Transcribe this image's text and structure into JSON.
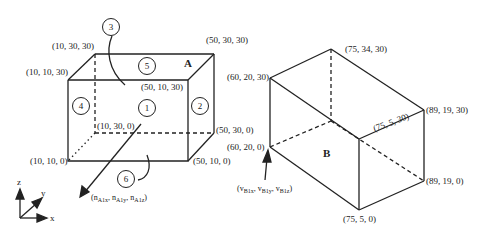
{
  "diagram": {
    "type": "3d-boxes",
    "box_a": {
      "label": "A",
      "vertices": {
        "top_back_left": "(10, 30, 30)",
        "top_back_right": "(50, 30, 30)",
        "top_front_left": "(10, 10, 30)",
        "top_front_right": "(50, 10, 30)",
        "bottom_back_left": "(10, 30, 0)",
        "bottom_back_right": "(50, 30, 0)",
        "bottom_front_left": "(10, 10, 0)",
        "bottom_front_right": "(50, 10, 0)"
      },
      "faces": [
        "1",
        "2",
        "3",
        "4",
        "5",
        "6"
      ],
      "normal_label_prefix": "(n",
      "normal_components": [
        "A1x",
        "A1y",
        "A1z"
      ]
    },
    "box_b": {
      "label": "B",
      "vertices": {
        "v1": "(75, 34, 30)",
        "v2": "(60, 20, 30)",
        "v3": "(89, 19, 30)",
        "v4": "(75, 5, 30)",
        "v5": "(60, 20, 0)",
        "v6": "(89, 19, 0)",
        "v7": "(75, 5, 0)"
      },
      "velocity_components": [
        "B1x",
        "B1y",
        "B1z"
      ]
    },
    "axes": {
      "x": "x",
      "y": "y",
      "z": "z"
    }
  }
}
